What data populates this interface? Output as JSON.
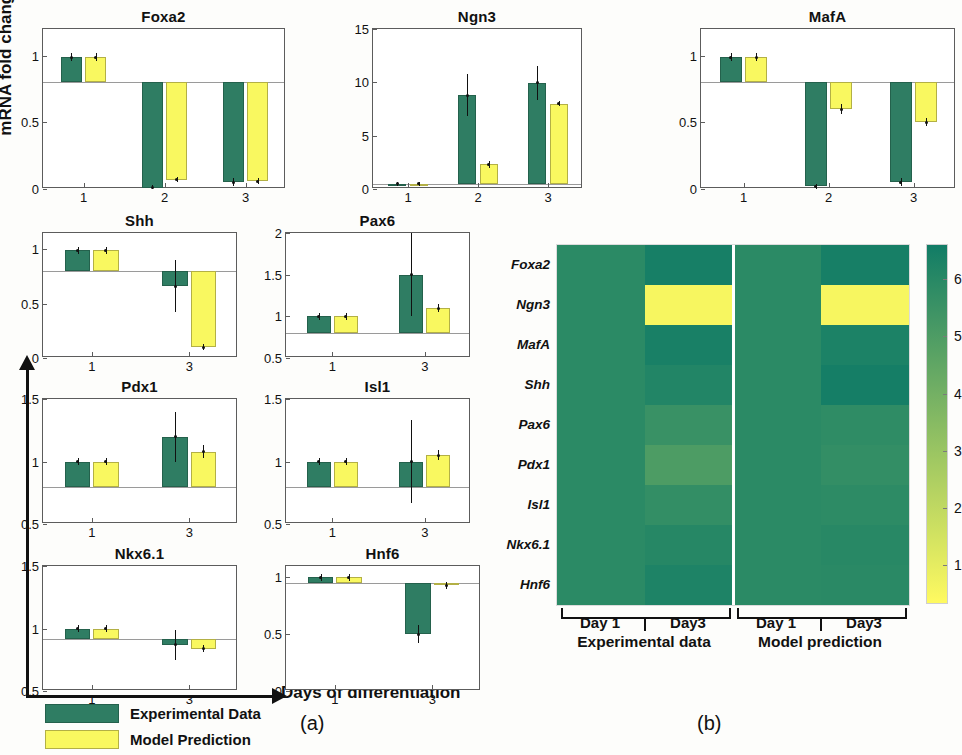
{
  "figure": {
    "y_axis_label": "mRNA fold change",
    "x_axis_label": "Days of differentiation",
    "caption_a": "(a)",
    "caption_b": "(b)"
  },
  "legend": {
    "experimental_label": "Experimental Data",
    "model_label": "Model Prediction",
    "experimental_color": "#2f7d63",
    "model_color": "#f9f860"
  },
  "chart_data": [
    {
      "type": "bar",
      "title": "Foxa2",
      "xlabel": "",
      "ylabel": "mRNA fold change",
      "categories": [
        "1",
        "2",
        "3"
      ],
      "yticks": [
        0,
        0.5,
        1
      ],
      "ylim": [
        0,
        1.2
      ],
      "baseline": 0.8,
      "series": [
        {
          "name": "Experimental Data",
          "values": [
            0.99,
            0.01,
            0.05
          ],
          "errors": [
            0.03,
            0.02,
            0.03
          ]
        },
        {
          "name": "Model Prediction",
          "values": [
            0.99,
            0.07,
            0.06
          ],
          "errors": [
            0.03,
            0.02,
            0.02
          ]
        }
      ]
    },
    {
      "type": "bar",
      "title": "Ngn3",
      "xlabel": "",
      "ylabel": "mRNA fold change",
      "categories": [
        "1",
        "2",
        "3"
      ],
      "yticks": [
        0,
        5,
        10,
        15
      ],
      "ylim": [
        0,
        15
      ],
      "baseline": 0.5,
      "series": [
        {
          "name": "Experimental Data",
          "values": [
            0.5,
            8.8,
            9.95
          ],
          "errors": [
            0.2,
            2.0,
            1.6
          ]
        },
        {
          "name": "Model Prediction",
          "values": [
            0.5,
            2.3,
            8.0
          ],
          "errors": [
            0.2,
            0.35,
            0.25
          ]
        }
      ]
    },
    {
      "type": "bar",
      "title": "MafA",
      "xlabel": "",
      "ylabel": "mRNA fold change",
      "categories": [
        "1",
        "2",
        "3"
      ],
      "yticks": [
        0,
        0.5,
        1
      ],
      "ylim": [
        0,
        1.2
      ],
      "baseline": 0.8,
      "series": [
        {
          "name": "Experimental Data",
          "values": [
            0.99,
            0.02,
            0.05
          ],
          "errors": [
            0.03,
            0.02,
            0.03
          ]
        },
        {
          "name": "Model Prediction",
          "values": [
            0.99,
            0.6,
            0.5
          ],
          "errors": [
            0.03,
            0.04,
            0.03
          ]
        }
      ]
    },
    {
      "type": "bar",
      "title": "Shh",
      "xlabel": "",
      "ylabel": "mRNA fold change",
      "categories": [
        "1",
        "3"
      ],
      "yticks": [
        0,
        0.5,
        1
      ],
      "ylim": [
        0,
        1.15
      ],
      "baseline": 0.8,
      "series": [
        {
          "name": "Experimental Data",
          "values": [
            0.99,
            0.66
          ],
          "errors": [
            0.03,
            0.24
          ]
        },
        {
          "name": "Model Prediction",
          "values": [
            0.99,
            0.1
          ],
          "errors": [
            0.03,
            0.03
          ]
        }
      ]
    },
    {
      "type": "bar",
      "title": "Pax6",
      "xlabel": "",
      "ylabel": "mRNA fold change",
      "categories": [
        "1",
        "3"
      ],
      "yticks": [
        0.5,
        1,
        1.5,
        2
      ],
      "ylim": [
        0.5,
        2
      ],
      "baseline": 0.8,
      "series": [
        {
          "name": "Experimental Data",
          "values": [
            1.0,
            1.5
          ],
          "errors": [
            0.04,
            0.5
          ]
        },
        {
          "name": "Model Prediction",
          "values": [
            1.0,
            1.1
          ],
          "errors": [
            0.04,
            0.05
          ]
        }
      ]
    },
    {
      "type": "bar",
      "title": "Pdx1",
      "xlabel": "",
      "ylabel": "mRNA fold change",
      "categories": [
        "1",
        "3"
      ],
      "yticks": [
        0.5,
        1,
        1.5
      ],
      "ylim": [
        0.5,
        1.5
      ],
      "baseline": 0.8,
      "series": [
        {
          "name": "Experimental Data",
          "values": [
            1.0,
            1.2
          ],
          "errors": [
            0.03,
            0.2
          ]
        },
        {
          "name": "Model Prediction",
          "values": [
            1.0,
            1.08
          ],
          "errors": [
            0.03,
            0.05
          ]
        }
      ]
    },
    {
      "type": "bar",
      "title": "Isl1",
      "xlabel": "",
      "ylabel": "mRNA fold change",
      "categories": [
        "1",
        "3"
      ],
      "yticks": [
        0.5,
        1,
        1.5
      ],
      "ylim": [
        0.5,
        1.5
      ],
      "baseline": 0.8,
      "series": [
        {
          "name": "Experimental Data",
          "values": [
            1.0,
            1.0
          ],
          "errors": [
            0.03,
            0.33
          ]
        },
        {
          "name": "Model Prediction",
          "values": [
            1.0,
            1.05
          ],
          "errors": [
            0.03,
            0.04
          ]
        }
      ]
    },
    {
      "type": "bar",
      "title": "Nkx6.1",
      "xlabel": "",
      "ylabel": "mRNA fold change",
      "categories": [
        "1",
        "3"
      ],
      "yticks": [
        0.5,
        1,
        1.5
      ],
      "ylim": [
        0.5,
        1.5
      ],
      "baseline": 0.92,
      "series": [
        {
          "name": "Experimental Data",
          "values": [
            1.0,
            0.87
          ],
          "errors": [
            0.03,
            0.12
          ]
        },
        {
          "name": "Model Prediction",
          "values": [
            1.0,
            0.84
          ],
          "errors": [
            0.03,
            0.03
          ]
        }
      ]
    },
    {
      "type": "bar",
      "title": "Hnf6",
      "xlabel": "",
      "ylabel": "mRNA fold change",
      "categories": [
        "1",
        "3"
      ],
      "yticks": [
        0,
        0.5,
        1
      ],
      "ylim": [
        0,
        1.1
      ],
      "baseline": 0.95,
      "series": [
        {
          "name": "Experimental Data",
          "values": [
            1.0,
            0.5
          ],
          "errors": [
            0.03,
            0.08
          ]
        },
        {
          "name": "Model Prediction",
          "values": [
            1.0,
            0.93
          ],
          "errors": [
            0.03,
            0.03
          ]
        }
      ]
    },
    {
      "type": "heatmap",
      "title": "",
      "rows": [
        "Foxa2",
        "Ngn3",
        "MafA",
        "Shh",
        "Pax6",
        "Pdx1",
        "Isl1",
        "Nkx6.1",
        "Hnf6"
      ],
      "columns": [
        "Day 1",
        "Day3",
        "Day 1",
        "Day3"
      ],
      "column_groups": [
        "Experimental data",
        "Model prediction"
      ],
      "colorbar_ticks": [
        1,
        2,
        3,
        4,
        5,
        6
      ],
      "clim": [
        0.3,
        6.6
      ],
      "values": [
        [
          1.0,
          0.45,
          1.0,
          0.45
        ],
        [
          1.0,
          6.4,
          1.0,
          6.4
        ],
        [
          1.0,
          0.5,
          1.0,
          0.6
        ],
        [
          1.0,
          0.75,
          1.0,
          0.4
        ],
        [
          1.0,
          1.35,
          1.0,
          1.1
        ],
        [
          1.0,
          1.9,
          1.0,
          1.2
        ],
        [
          1.0,
          1.2,
          1.0,
          1.05
        ],
        [
          1.0,
          0.85,
          1.0,
          0.9
        ],
        [
          1.0,
          0.65,
          1.0,
          0.95
        ]
      ]
    }
  ]
}
